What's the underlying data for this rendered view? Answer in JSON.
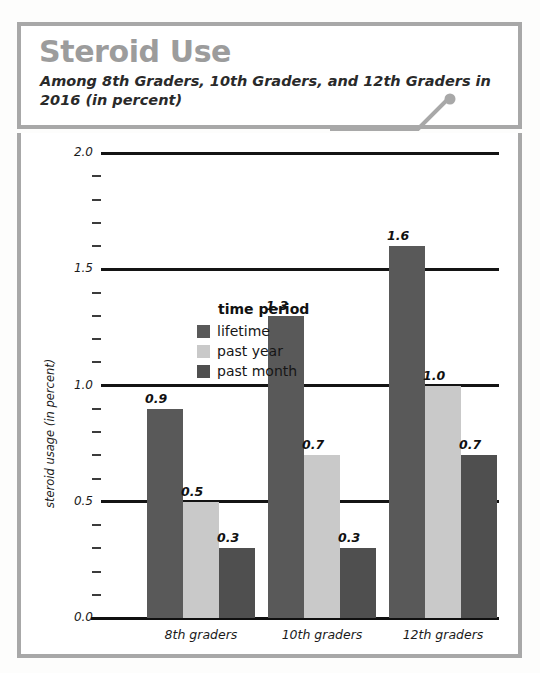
{
  "header": {
    "title": "Steroid Use",
    "subtitle": "Among 8th Graders, 10th Graders, and 12th Graders in 2016 (in percent)",
    "title_color": "#9c9c9c",
    "frame_color": "#a8a8a8",
    "pointer_icon": "line-with-dot-icon"
  },
  "legend": {
    "title": "time period",
    "items": [
      {
        "label": "lifetime",
        "color": "#595959"
      },
      {
        "label": "past year",
        "color": "#c9c9c9"
      },
      {
        "label": "past month",
        "color": "#4f4f4f"
      }
    ]
  },
  "axes": {
    "ylabel": "steroid usage (in percent)",
    "yticks": [
      "0.0",
      "0.5",
      "1.0",
      "1.5",
      "2.0"
    ],
    "ymin": 0.0,
    "ymax": 2.0,
    "minor_ticks_per_interval": 4
  },
  "chart_data": {
    "type": "bar",
    "title": "Steroid Use",
    "subtitle": "Among 8th Graders, 10th Graders, and 12th Graders in 2016 (in percent)",
    "xlabel": "",
    "ylabel": "steroid usage (in percent)",
    "ylim": [
      0.0,
      2.0
    ],
    "ytick_values": [
      0.0,
      0.5,
      1.0,
      1.5,
      2.0
    ],
    "grid": true,
    "legend_position": "inside-top-left",
    "legend_title": "time period",
    "categories": [
      "8th graders",
      "10th graders",
      "12th graders"
    ],
    "series": [
      {
        "name": "lifetime",
        "color": "#595959",
        "values": [
          0.9,
          1.3,
          1.6
        ],
        "labels": [
          "0.9",
          "1.3",
          "1.6"
        ]
      },
      {
        "name": "past year",
        "color": "#c9c9c9",
        "values": [
          0.5,
          0.7,
          1.0
        ],
        "labels": [
          "0.5",
          "0.7",
          "1.0"
        ]
      },
      {
        "name": "past month",
        "color": "#4f4f4f",
        "values": [
          0.3,
          0.3,
          0.7
        ],
        "labels": [
          "0.3",
          "0.3",
          "0.7"
        ]
      }
    ]
  }
}
